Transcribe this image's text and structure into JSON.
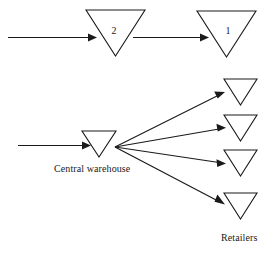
{
  "diagram": {
    "type": "distribution-network-diagram",
    "background_color": "#ffffff",
    "line_color": "#1a1a1a",
    "node_fill": "#ffffff",
    "upper_row": {
      "inbound_arrow_label": "",
      "nodes": [
        {
          "id": "stage-2",
          "label": "2",
          "shape": "inverted-triangle"
        },
        {
          "id": "stage-1",
          "label": "1",
          "shape": "inverted-triangle"
        }
      ]
    },
    "lower_row": {
      "central_node": {
        "id": "central-warehouse",
        "label": "",
        "shape": "inverted-triangle"
      },
      "central_caption": "Central warehouse",
      "retailers_caption": "Retailers",
      "retailers": [
        {
          "id": "retailer-1",
          "label": "",
          "shape": "inverted-triangle"
        },
        {
          "id": "retailer-2",
          "label": "",
          "shape": "inverted-triangle"
        },
        {
          "id": "retailer-3",
          "label": "",
          "shape": "inverted-triangle"
        },
        {
          "id": "retailer-4",
          "label": "",
          "shape": "inverted-triangle"
        }
      ]
    }
  }
}
